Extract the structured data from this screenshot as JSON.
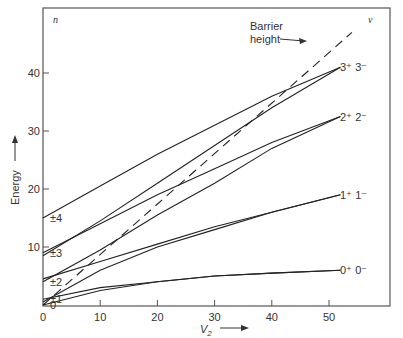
{
  "chart_data": {
    "type": "line",
    "title": "",
    "xlabel": "V2",
    "xlabel_display": {
      "base": "V",
      "sub": "2"
    },
    "ylabel": "Energy",
    "xlim": [
      0,
      60
    ],
    "ylim": [
      0,
      48
    ],
    "x_ticks": [
      "0",
      "10",
      "20",
      "30",
      "40",
      "50"
    ],
    "y_ticks": [
      "10",
      "20",
      "30",
      "40"
    ],
    "grid": false,
    "corner_labels": {
      "left": "n",
      "right": "ν"
    },
    "left_level_labels": [
      {
        "text": "±4",
        "y": 15
      },
      {
        "text": "±3",
        "y": 9
      },
      {
        "text": "±2",
        "y": 4
      },
      {
        "text": "±1",
        "y": 1
      },
      {
        "text": "0",
        "y": 0
      }
    ],
    "right_level_labels": [
      {
        "text": "3⁺ 3⁻",
        "y": 41
      },
      {
        "text": "2⁺ 2⁻",
        "y": 32.5
      },
      {
        "text": "1⁺ 1⁻",
        "y": 19
      },
      {
        "text": "0⁺ 0⁻",
        "y": 6
      }
    ],
    "annotation": {
      "text_line1": "Barrier",
      "text_line2": "height",
      "arrow_to": [
        39,
        43
      ]
    },
    "series": [
      {
        "name": "n=±4 → 3+",
        "style": "solid",
        "x": [
          0,
          10,
          20,
          30,
          40,
          52
        ],
        "y": [
          15,
          20.5,
          26,
          31,
          36,
          41
        ]
      },
      {
        "name": "n=±3 → 3−",
        "style": "solid",
        "x": [
          0,
          10,
          20,
          30,
          40,
          52
        ],
        "y": [
          8.5,
          14.5,
          21,
          27.5,
          34,
          41
        ]
      },
      {
        "name": "n=±3 → 2+",
        "style": "solid",
        "x": [
          0,
          10,
          20,
          30,
          40,
          52
        ],
        "y": [
          9,
          14,
          19,
          23.5,
          28,
          32.5
        ]
      },
      {
        "name": "n=±2 → 2−",
        "style": "solid",
        "x": [
          0,
          10,
          20,
          30,
          40,
          52
        ],
        "y": [
          4,
          9.5,
          15.5,
          21,
          27,
          32.5
        ]
      },
      {
        "name": "n=±2 → 1+",
        "style": "solid",
        "x": [
          0,
          10,
          20,
          30,
          40,
          52
        ],
        "y": [
          4.5,
          7.5,
          10.5,
          13.5,
          16,
          19
        ]
      },
      {
        "name": "n=±1 → 1−",
        "style": "solid",
        "x": [
          0,
          10,
          20,
          30,
          40,
          52
        ],
        "y": [
          0.5,
          6,
          10,
          13,
          16,
          19
        ]
      },
      {
        "name": "n=±1 → 0+",
        "style": "solid",
        "x": [
          0,
          10,
          20,
          30,
          40,
          52
        ],
        "y": [
          1,
          3,
          4,
          5,
          5.5,
          6
        ]
      },
      {
        "name": "n=0 → 0−",
        "style": "solid",
        "x": [
          0,
          10,
          20,
          30,
          40,
          52
        ],
        "y": [
          0,
          2.5,
          4,
          5,
          5.5,
          6
        ]
      },
      {
        "name": "Barrier height",
        "style": "dashed",
        "x": [
          0,
          54
        ],
        "y": [
          0,
          47
        ]
      }
    ]
  }
}
